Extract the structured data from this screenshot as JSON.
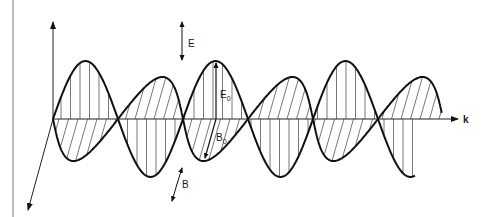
{
  "diagram": {
    "labels": {
      "e_field": "E",
      "b_field": "B",
      "e_amplitude": "E",
      "e_amplitude_sub": "0",
      "b_amplitude": "B",
      "b_amplitude_sub": "0",
      "propagation": "k"
    },
    "geometry": {
      "axis_y": 119,
      "origin_x": 53,
      "k_axis_end_x": 458,
      "vertical_axis_top_y": 22,
      "diag_axis_end": [
        28,
        210
      ],
      "frame_line_x": 13,
      "nodes_x": [
        53,
        118,
        183,
        250,
        315,
        380
      ],
      "e_wave_end_x": 415,
      "b_wave_end_x": 440,
      "e_amplitude_px": 58,
      "b_amplitude_px": 42,
      "b_skew_px": 12
    },
    "colors": {
      "curve": "#111111",
      "hatch": "#555555",
      "axis": "#222222",
      "frame": "#777777"
    }
  }
}
